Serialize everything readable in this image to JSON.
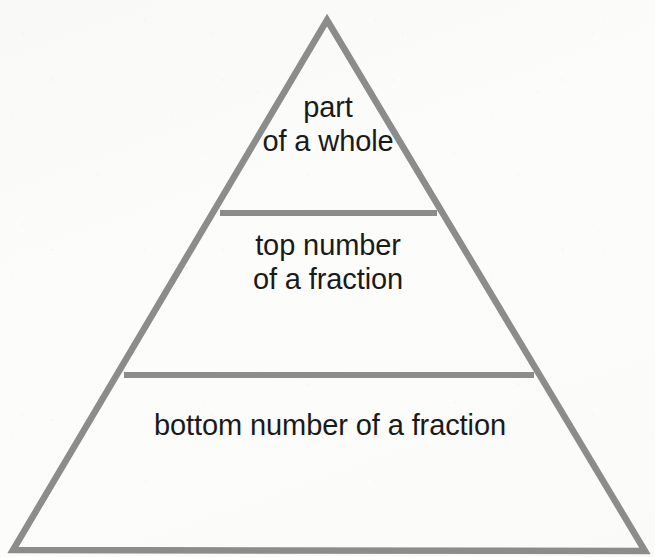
{
  "diagram": {
    "type": "pyramid",
    "shape_name": "triangle",
    "tier_count": 3,
    "stroke_color": "#8c8c8c",
    "text_color": "#1a1a1a",
    "background_color": "#fcfcfb",
    "stroke_width": 6,
    "geometry": {
      "apex": [
        327,
        20
      ],
      "bottom_left": [
        13,
        550
      ],
      "bottom_right": [
        645,
        551
      ],
      "divider_1": {
        "y": 213,
        "x_start": 220,
        "x_end": 437
      },
      "divider_2": {
        "y": 375,
        "x_start": 124,
        "x_end": 534
      }
    },
    "tiers": [
      {
        "id": "top",
        "position": 1,
        "label": "part\nof a whole",
        "line_1": "part",
        "line_2": "of a whole"
      },
      {
        "id": "middle",
        "position": 2,
        "label": "top number\nof a fraction",
        "line_1": "top number",
        "line_2": "of a fraction"
      },
      {
        "id": "bottom",
        "position": 3,
        "label": "bottom number of a fraction",
        "line_1": "bottom number of a fraction",
        "line_2": ""
      }
    ]
  }
}
